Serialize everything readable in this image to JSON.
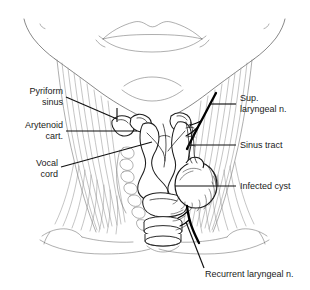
{
  "figure": {
    "background_color": "#ffffff",
    "line_color": "#555555",
    "text_color": "#1a1a1a",
    "nerve_color": "#000000"
  },
  "labels": {
    "pyriform_sinus": {
      "line1": "Pyriform",
      "line2": "sinus"
    },
    "arytenoid_cart": {
      "line1": "Arytenoid",
      "line2": "cart."
    },
    "vocal_cord": {
      "line1": "Vocal",
      "line2": "cord"
    },
    "sup_laryngeal_n": {
      "line1": "Sup.",
      "line2": "laryngeal n."
    },
    "sinus_tract": {
      "line1": "Sinus tract"
    },
    "infected_cyst": {
      "line1": "Infected cyst"
    },
    "recurrent_laryngeal_n": {
      "line1": "Recurrent laryngeal n."
    }
  },
  "structures": [
    {
      "name": "lips",
      "side": "center"
    },
    {
      "name": "jaw-outline",
      "side": "both"
    },
    {
      "name": "neck-muscles",
      "side": "both"
    },
    {
      "name": "thyroid-cartilage",
      "side": "center"
    },
    {
      "name": "arytenoid-cartilage",
      "side": "both"
    },
    {
      "name": "vocal-cord",
      "side": "center"
    },
    {
      "name": "pyriform-sinus",
      "side": "left"
    },
    {
      "name": "trachea-rings",
      "side": "center"
    },
    {
      "name": "superior-laryngeal-nerve",
      "side": "right"
    },
    {
      "name": "sinus-tract",
      "side": "right"
    },
    {
      "name": "infected-cyst",
      "side": "right"
    },
    {
      "name": "recurrent-laryngeal-nerve",
      "side": "right"
    }
  ]
}
